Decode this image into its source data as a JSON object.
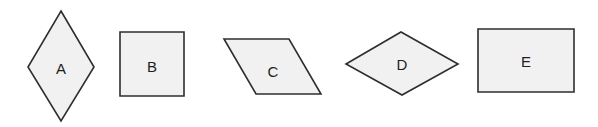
{
  "colors": {
    "background": "#ffffff",
    "fill": "#f1f1f1",
    "stroke": "#2e2e2e",
    "text": "#1e1e1e"
  },
  "shapes": [
    {
      "id": "A",
      "label": "A",
      "type": "rhombus-vertical",
      "points": "61,11 94,67 61,121 28,67",
      "label_pos": [
        61,
        68
      ]
    },
    {
      "id": "B",
      "label": "B",
      "type": "square",
      "points": "120,32 184,32 184,96 120,96",
      "label_pos": [
        152,
        66
      ]
    },
    {
      "id": "C",
      "label": "C",
      "type": "parallelogram",
      "points": "224,39 289,39 321,94 256,94",
      "label_pos": [
        273,
        71
      ]
    },
    {
      "id": "D",
      "label": "D",
      "type": "rhombus-horizontal",
      "points": "346,64 401,32 458,64 402,95",
      "label_pos": [
        402,
        64
      ]
    },
    {
      "id": "E",
      "label": "E",
      "type": "rectangle",
      "points": "478,29 574,29 574,92 478,92",
      "label_pos": [
        526,
        61
      ]
    }
  ]
}
